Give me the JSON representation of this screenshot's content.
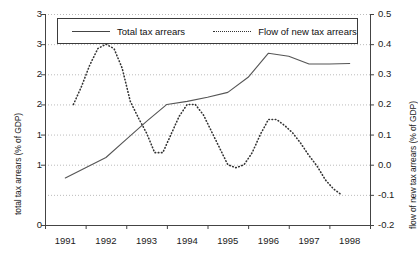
{
  "chart_data": {
    "type": "line",
    "title": "",
    "subtitle": "",
    "xlabel": "",
    "ylabel": "total tax arrears (% of GDP)",
    "ylabel_right": "flow of new tax arrears (% of GDP)",
    "grid": true,
    "legend_position": "top-inside",
    "x": [
      "1991",
      "1992",
      "1993",
      "1994",
      "1995",
      "1996",
      "1997",
      "1998"
    ],
    "xtick_labels": [
      "1991",
      "1992",
      "1993",
      "1994",
      "1995",
      "1996",
      "1997",
      "1998"
    ],
    "ytick_labels_left": [
      "3",
      "3",
      "2",
      "2",
      "1",
      "1",
      "0"
    ],
    "ytick_values_left": [
      3.5,
      3.0,
      2.5,
      2.0,
      1.5,
      1.0,
      0.0
    ],
    "ytick_labels_right": [
      "0.5",
      "0.4",
      "0.3",
      "0.2",
      "0.1",
      "0.0",
      "-0.1",
      "-0.2"
    ],
    "ytick_values_right": [
      0.5,
      0.4,
      0.3,
      0.2,
      0.1,
      0.0,
      -0.1,
      -0.2
    ],
    "ylim_left": [
      0.0,
      3.5
    ],
    "ylim_right": [
      -0.2,
      0.5
    ],
    "series": [
      {
        "name": "Total tax arrears",
        "axis": "left",
        "style": "solid",
        "color": "#555555",
        "x": [
          1991.0,
          1991.5,
          1992.0,
          1992.5,
          1993.0,
          1993.5,
          1994.0,
          1994.5,
          1995.0,
          1995.5,
          1996.0,
          1996.5,
          1997.0,
          1997.5,
          1998.0
        ],
        "values": [
          0.78,
          0.95,
          1.12,
          1.42,
          1.72,
          2.0,
          2.05,
          2.12,
          2.2,
          2.45,
          2.85,
          2.8,
          2.67,
          2.67,
          2.68
        ]
      },
      {
        "name": "Flow of new tax arrears",
        "axis": "right",
        "style": "dotted",
        "color": "#333333",
        "x": [
          1991.2,
          1991.4,
          1991.6,
          1991.8,
          1992.0,
          1992.2,
          1992.4,
          1992.6,
          1992.8,
          1993.0,
          1993.2,
          1993.4,
          1993.6,
          1993.8,
          1994.0,
          1994.2,
          1994.4,
          1994.6,
          1994.8,
          1995.0,
          1995.2,
          1995.4,
          1995.6,
          1995.8,
          1996.0,
          1996.2,
          1996.4,
          1996.6,
          1996.8,
          1997.0,
          1997.2,
          1997.4,
          1997.6,
          1997.8
        ],
        "values": [
          0.2,
          0.26,
          0.33,
          0.385,
          0.4,
          0.385,
          0.32,
          0.21,
          0.155,
          0.105,
          0.04,
          0.04,
          0.1,
          0.16,
          0.2,
          0.2,
          0.165,
          0.11,
          0.055,
          0.0,
          -0.01,
          0.0,
          0.04,
          0.1,
          0.15,
          0.15,
          0.13,
          0.105,
          0.07,
          0.03,
          -0.005,
          -0.05,
          -0.08,
          -0.1
        ]
      }
    ],
    "annotations": []
  },
  "legend": {
    "items": [
      {
        "label": "Total tax arrears",
        "marker": "solid-line"
      },
      {
        "label": "Flow of new tax arrears",
        "marker": "dotted-line"
      }
    ]
  },
  "colors": {
    "background": "#ffffff",
    "axis": "#444444",
    "grid": "#aaaaaa",
    "series_total": "#555555",
    "series_flow": "#333333",
    "text": "#1a1a1a"
  }
}
